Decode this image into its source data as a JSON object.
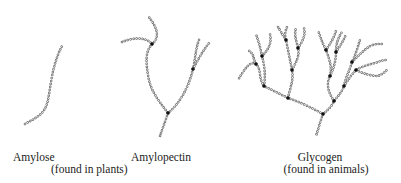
{
  "figure": {
    "colors": {
      "chain": "#6b6b6b",
      "branch_node": "#111111",
      "text": "#222222",
      "background": "#ffffff"
    },
    "molecules": [
      {
        "name": "Amylose",
        "structure": "unbranched chain"
      },
      {
        "name": "Amylopectin",
        "structure": "branched chain (few branches)"
      },
      {
        "name": "Glycogen",
        "structure": "highly branched chain"
      }
    ],
    "labels": {
      "amylose": "Amylose",
      "amylopectin": "Amylopectin",
      "plants_note": "(found in plants)",
      "glycogen": "Glycogen",
      "animals_note": "(found in animals)"
    }
  }
}
